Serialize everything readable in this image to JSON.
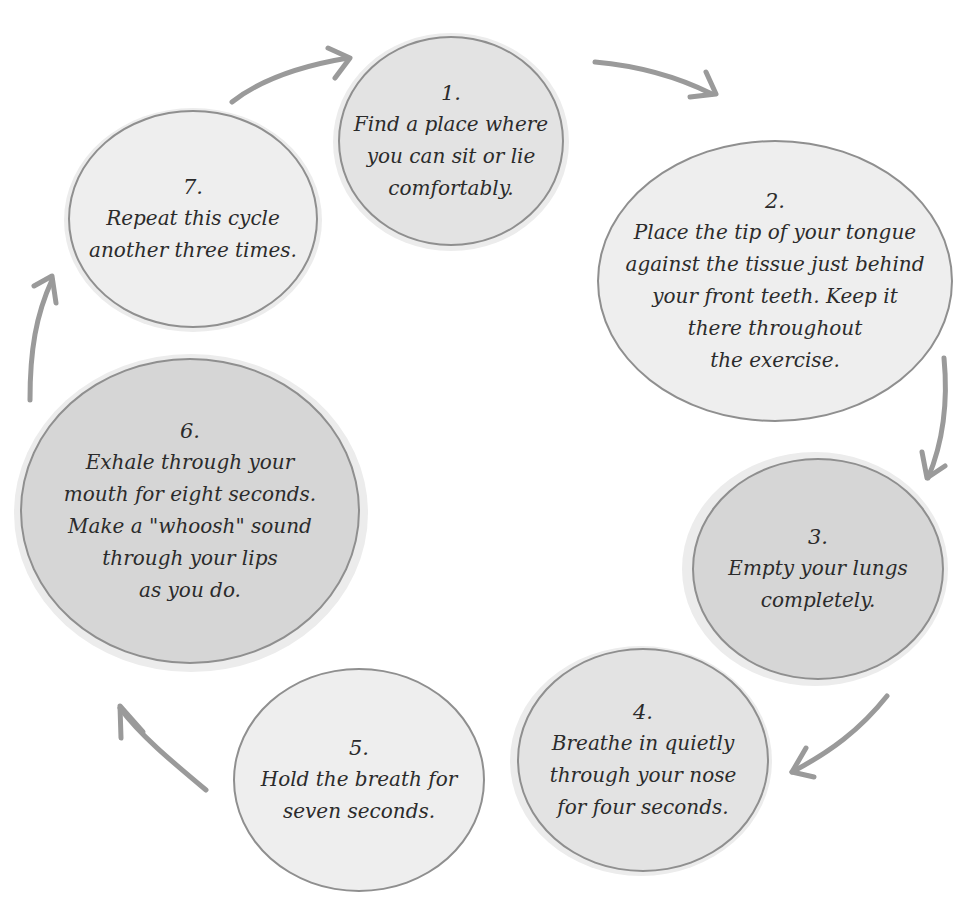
{
  "diagram": {
    "type": "cycle",
    "title": "",
    "colors": {
      "arrow": "#9a9a9a",
      "border": "#8f8f8f",
      "fill_light": "#eeeeee",
      "fill_mid": "#e3e3e3",
      "fill_dark": "#d6d6d6",
      "text": "#2b2b2b"
    },
    "steps": [
      {
        "number": "1.",
        "text": "Find a place where\nyou can sit or lie\ncomfortably."
      },
      {
        "number": "2.",
        "text": "Place the tip of your tongue\nagainst the tissue just behind\nyour front teeth. Keep it\nthere throughout\nthe exercise."
      },
      {
        "number": "3.",
        "text": "Empty your lungs\ncompletely."
      },
      {
        "number": "4.",
        "text": "Breathe in quietly\nthrough your nose\nfor four seconds."
      },
      {
        "number": "5.",
        "text": "Hold the breath for\nseven seconds."
      },
      {
        "number": "6.",
        "text": "Exhale through your\nmouth for eight seconds.\nMake a \"whoosh\" sound\nthrough your lips\nas you do."
      },
      {
        "number": "7.",
        "text": "Repeat this cycle\nanother three times."
      }
    ],
    "arrows": [
      {
        "from": "1",
        "to": "2",
        "icon": "curved-arrow-icon"
      },
      {
        "from": "2",
        "to": "3",
        "icon": "curved-arrow-icon"
      },
      {
        "from": "3",
        "to": "4",
        "icon": "curved-arrow-icon"
      },
      {
        "from": "4",
        "to": "5",
        "icon": "curved-arrow-icon"
      },
      {
        "from": "5",
        "to": "6",
        "icon": "curved-arrow-icon"
      },
      {
        "from": "6",
        "to": "7",
        "icon": "curved-arrow-icon"
      },
      {
        "from": "7",
        "to": "1",
        "icon": "curved-arrow-icon"
      }
    ]
  }
}
